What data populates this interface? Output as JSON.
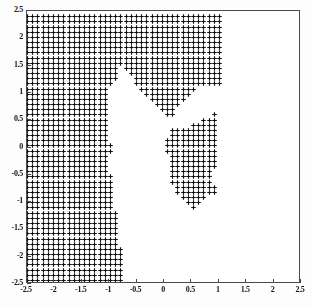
{
  "chart_data": {
    "type": "scatter",
    "title": "",
    "xlabel": "",
    "ylabel": "",
    "xlim": [
      -2.5,
      2.5
    ],
    "ylim": [
      -2.5,
      2.5
    ],
    "grid": false,
    "legend": null,
    "marker": "plus",
    "marker_color": "#111111",
    "point_spacing": 0.0947,
    "xticks": [
      -2.5,
      -2,
      -1.5,
      -1,
      -0.5,
      0,
      0.5,
      1,
      1.5,
      2,
      2.5
    ],
    "yticks": [
      2.5,
      2,
      1.5,
      1,
      0.5,
      0,
      -0.5,
      -1,
      -1.5,
      -2,
      -2.5
    ],
    "xticklabels": [
      "-2.5",
      "-2",
      "-1.5",
      "-1",
      "-0.5",
      "0",
      "0.5",
      "1",
      "1.5",
      "2",
      "2.5"
    ],
    "yticklabels": [
      "2.5",
      "2",
      "1.5",
      "1",
      "0.5",
      "0",
      "-0.5",
      "-1",
      "-1.5",
      "-2",
      "-2.5"
    ],
    "region_polygons": [
      {
        "name": "left-mass",
        "points": [
          [
            -2.5,
            -2.5
          ],
          [
            -0.76,
            -2.5
          ],
          [
            -0.76,
            -1.83
          ],
          [
            -0.86,
            -1.83
          ],
          [
            -0.86,
            -1.15
          ],
          [
            -0.95,
            -1.15
          ],
          [
            -0.95,
            -0.5
          ],
          [
            -1.05,
            -0.5
          ],
          [
            -1.05,
            -0.12
          ],
          [
            -0.95,
            -0.12
          ],
          [
            -0.95,
            0.1
          ],
          [
            -1.05,
            0.1
          ],
          [
            -1.05,
            1.12
          ],
          [
            -0.95,
            1.12
          ],
          [
            -0.86,
            1.3
          ],
          [
            -0.76,
            1.55
          ],
          [
            -0.67,
            1.4
          ],
          [
            -0.57,
            1.25
          ],
          [
            -0.48,
            1.12
          ],
          [
            -0.38,
            1.05
          ],
          [
            -0.29,
            0.92
          ],
          [
            -0.19,
            0.8
          ],
          [
            -0.1,
            0.7
          ],
          [
            0.0,
            0.6
          ],
          [
            0.09,
            0.5
          ],
          [
            0.19,
            0.62
          ],
          [
            0.28,
            0.75
          ],
          [
            0.38,
            0.88
          ],
          [
            0.47,
            0.98
          ],
          [
            0.57,
            1.05
          ],
          [
            0.66,
            1.1
          ],
          [
            0.76,
            1.12
          ],
          [
            0.85,
            1.12
          ],
          [
            0.95,
            1.12
          ],
          [
            1.04,
            1.1
          ],
          [
            1.09,
            1.25
          ],
          [
            1.09,
            2.5
          ],
          [
            -2.5,
            2.5
          ]
        ]
      },
      {
        "name": "right-lobe",
        "points": [
          [
            0.19,
            0.4
          ],
          [
            0.38,
            0.35
          ],
          [
            0.57,
            0.45
          ],
          [
            0.76,
            0.55
          ],
          [
            0.85,
            0.62
          ],
          [
            0.95,
            0.6
          ],
          [
            1.0,
            0.45
          ],
          [
            1.0,
            0.1
          ],
          [
            0.95,
            -0.2
          ],
          [
            0.9,
            -0.45
          ],
          [
            0.9,
            -0.7
          ],
          [
            0.95,
            -0.78
          ],
          [
            0.9,
            -0.88
          ],
          [
            0.76,
            -0.92
          ],
          [
            0.66,
            -1.05
          ],
          [
            0.57,
            -1.12
          ],
          [
            0.47,
            -1.1
          ],
          [
            0.38,
            -1.02
          ],
          [
            0.28,
            -0.92
          ],
          [
            0.19,
            -0.78
          ],
          [
            0.14,
            -0.6
          ],
          [
            0.14,
            -0.3
          ],
          [
            0.09,
            -0.1
          ],
          [
            0.0,
            0.0
          ],
          [
            -0.05,
            0.0
          ],
          [
            0.0,
            0.12
          ],
          [
            0.09,
            0.22
          ],
          [
            0.14,
            0.32
          ]
        ]
      }
    ],
    "point_count_approx": 1850
  },
  "axes": {
    "box_color": "#4a4a4a",
    "tick_direction": "in",
    "background": "#ffffff"
  }
}
